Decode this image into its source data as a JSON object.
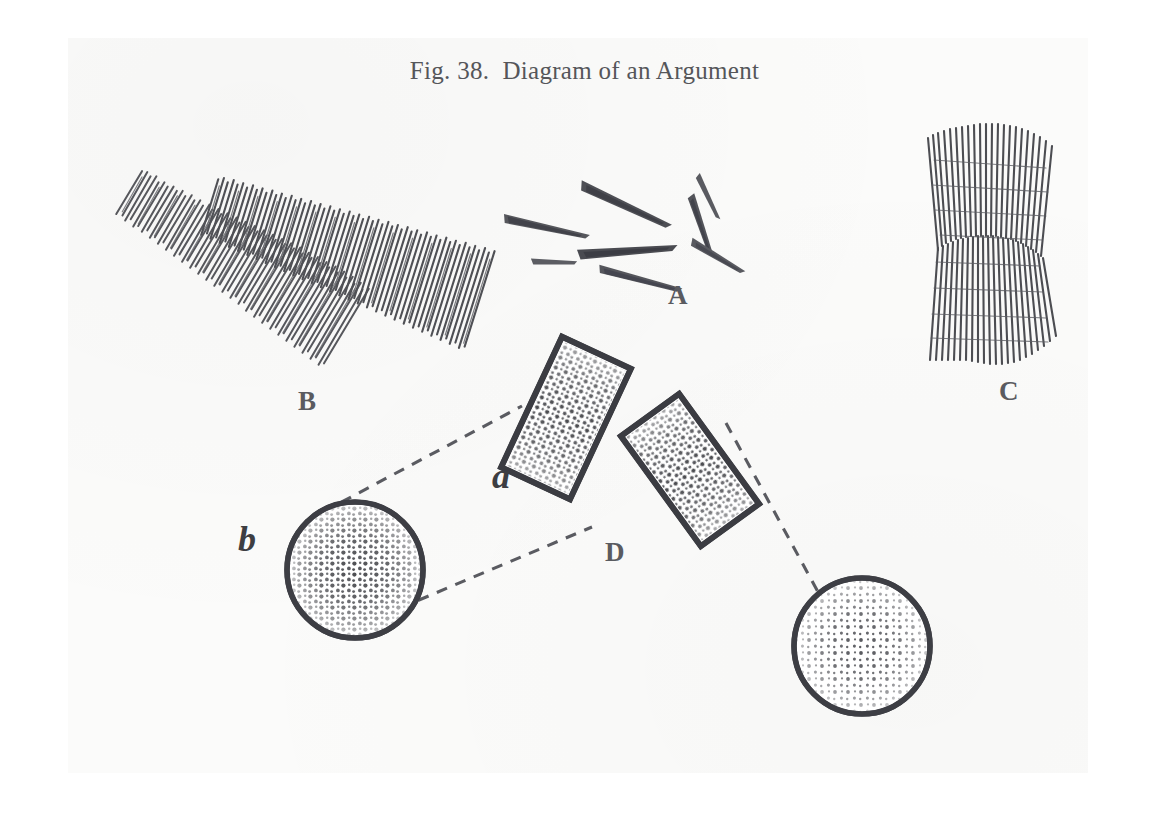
{
  "figure": {
    "title": "Fig. 38.  Diagram of an Argument",
    "title_prefix": "Fig. 38.",
    "figure_number": "38",
    "caption": "Diagram of an Argument",
    "medium": "scanned book page, halftone line engraving",
    "ink_color": "#4a4b4f",
    "paper_color": "#fbfbfa",
    "margin_color": "#ffffff"
  },
  "labels": {
    "A": "A",
    "B": "B",
    "C": "C",
    "D": "D",
    "a": "a",
    "b": "b"
  },
  "diagram_data": {
    "type": "diagram",
    "parts": [
      {
        "label": "A",
        "name": "scattered-splinters",
        "description": "loose cluster of small tapered dart-like splinters at varied angles",
        "element_count": 8,
        "center": [
          620,
          235
        ]
      },
      {
        "label": "B",
        "name": "two-hatched-bands",
        "description": "two separate bundles of fine parallel strokes, sloping, not joined",
        "band_count": 2,
        "center": [
          265,
          250
        ]
      },
      {
        "label": "C",
        "name": "waisted-hatched-bundle",
        "description": "single hourglass-waisted bundle of fine parallel strokes, flared at both ends",
        "band_count": 1,
        "center": [
          1000,
          245
        ]
      },
      {
        "label": "D",
        "name": "hinged-rectangles",
        "description": "two stippled rectangles meeting point-to-point in a shallow V",
        "rect_count": 2,
        "center": [
          618,
          470
        ]
      },
      {
        "label": "a",
        "name": "left-stippled-rectangle",
        "description": "left tilted rectangle of the hinged pair, filled with stipple"
      },
      {
        "label": "b",
        "name": "left-stippled-circle",
        "description": "outlined circle filled with dense stipple, densest at centre",
        "center": [
          355,
          570
        ],
        "radius": 68
      }
    ],
    "connectors": [
      {
        "name": "dashed-upper-b-to-a",
        "style": "dashed",
        "from": "circle-b-upper-left",
        "to": "rect-a-top-corner"
      },
      {
        "name": "dashed-lower-b-to-a",
        "style": "dashed",
        "from": "circle-b-lower-right",
        "to": "rect-a-bottom-corner"
      },
      {
        "name": "dashed-right-rect-to-circle",
        "style": "dashed",
        "from": "rect-right-top-corner",
        "to": "circle-right-upper-left"
      }
    ]
  }
}
